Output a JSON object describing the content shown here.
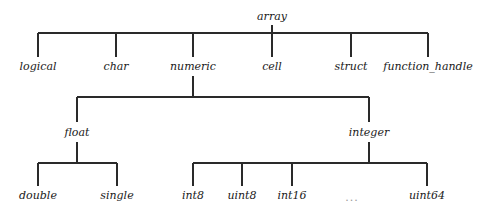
{
  "diagram": {
    "title": "",
    "type": "tree",
    "colors": {
      "line": "#2a2a2a",
      "text": "#1a1a1a",
      "ellipsis": "#9a9a9a",
      "background": "#ffffff"
    },
    "nodes": {
      "array": {
        "label": "array",
        "x": 272,
        "y": 17
      },
      "logical": {
        "label": "logical",
        "x": 38,
        "y": 67
      },
      "char": {
        "label": "char",
        "x": 116,
        "y": 67
      },
      "numeric": {
        "label": "numeric",
        "x": 193,
        "y": 67
      },
      "cell": {
        "label": "cell",
        "x": 272,
        "y": 67
      },
      "struct": {
        "label": "struct",
        "x": 351,
        "y": 67
      },
      "function_handle": {
        "label": "function_handle",
        "x": 428,
        "y": 67
      },
      "float": {
        "label": "float",
        "x": 77,
        "y": 133
      },
      "integer": {
        "label": "integer",
        "x": 369,
        "y": 133
      },
      "double": {
        "label": "double",
        "x": 38,
        "y": 196
      },
      "single": {
        "label": "single",
        "x": 117,
        "y": 196
      },
      "int8": {
        "label": "int8",
        "x": 193,
        "y": 196
      },
      "uint8": {
        "label": "uint8",
        "x": 242,
        "y": 196
      },
      "int16": {
        "label": "int16",
        "x": 292,
        "y": 196
      },
      "ellipsis": {
        "label": "...",
        "x": 352,
        "y": 198
      },
      "uint64": {
        "label": "uint64",
        "x": 427,
        "y": 196
      }
    },
    "edges": [
      {
        "from": "array",
        "to": "logical"
      },
      {
        "from": "array",
        "to": "char"
      },
      {
        "from": "array",
        "to": "numeric"
      },
      {
        "from": "array",
        "to": "cell"
      },
      {
        "from": "array",
        "to": "struct"
      },
      {
        "from": "array",
        "to": "function_handle"
      },
      {
        "from": "numeric",
        "to": "float"
      },
      {
        "from": "numeric",
        "to": "integer"
      },
      {
        "from": "float",
        "to": "double"
      },
      {
        "from": "float",
        "to": "single"
      },
      {
        "from": "integer",
        "to": "int8"
      },
      {
        "from": "integer",
        "to": "uint8"
      },
      {
        "from": "integer",
        "to": "int16"
      },
      {
        "from": "integer",
        "to": "uint64"
      }
    ]
  }
}
